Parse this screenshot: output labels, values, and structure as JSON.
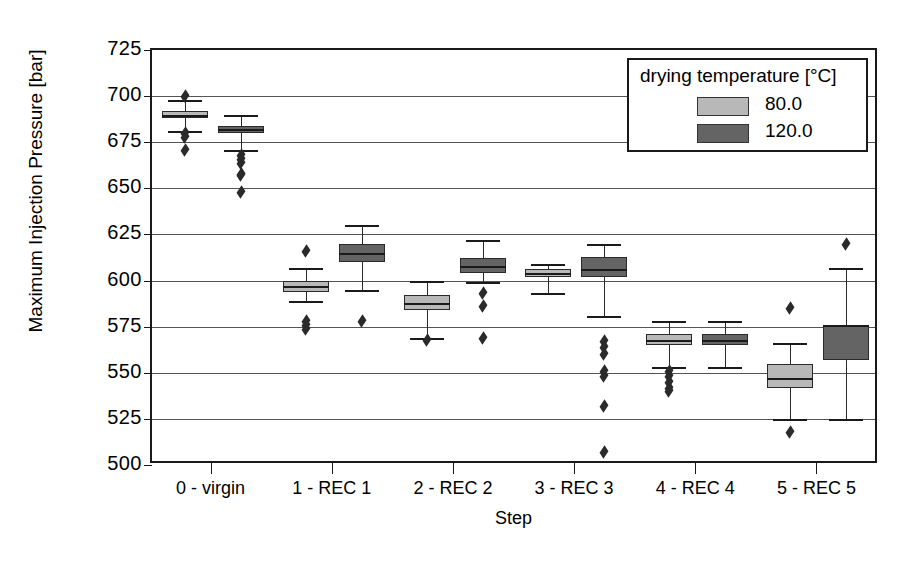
{
  "chart_data": {
    "type": "box",
    "title": "",
    "xlabel": "Step",
    "ylabel": "Maximum Injection Pressure  [bar]",
    "ylim": [
      500,
      725
    ],
    "ytick_step": 25,
    "yticks": [
      725,
      700,
      675,
      650,
      625,
      600,
      575,
      550,
      525,
      500
    ],
    "grid": true,
    "categories": [
      "0 - virgin",
      "1 - REC 1",
      "2 - REC 2",
      "3 - REC 3",
      "4 - REC 4",
      "5 - REC 5"
    ],
    "legend": {
      "title": "drying temperature [°C]",
      "position": "top-right",
      "entries": [
        {
          "label": "80.0",
          "color": "#b8b8b8"
        },
        {
          "label": "120.0",
          "color": "#646464"
        }
      ]
    },
    "series": [
      {
        "name": "80.0",
        "color": "#b8b8b8",
        "boxes": [
          {
            "category": "0 - virgin",
            "whisker_low": 681.0,
            "q1": 688.0,
            "median": 690.0,
            "q3": 692.0,
            "whisker_high": 698.0,
            "outliers": [
              700.0,
              680.0,
              678.0,
              671.0
            ]
          },
          {
            "category": "1 - REC 1",
            "whisker_low": 589.0,
            "q1": 594.0,
            "median": 597.0,
            "q3": 600.0,
            "whisker_high": 607.0,
            "outliers": [
              616.0,
              578.0,
              576.0,
              574.0
            ]
          },
          {
            "category": "2 - REC 2",
            "whisker_low": 569.0,
            "q1": 584.0,
            "median": 588.0,
            "q3": 592.0,
            "whisker_high": 600.0,
            "outliers": [
              568.0
            ]
          },
          {
            "category": "3 - REC 3",
            "whisker_low": 593.0,
            "q1": 602.0,
            "median": 604.0,
            "q3": 606.0,
            "whisker_high": 609.0,
            "outliers": []
          },
          {
            "category": "4 - REC 4",
            "whisker_low": 553.0,
            "q1": 565.0,
            "median": 568.0,
            "q3": 571.0,
            "whisker_high": 578.0,
            "outliers": [
              551.0,
              548.0,
              545.0,
              542.0,
              540.0
            ]
          },
          {
            "category": "5 - REC 5",
            "whisker_low": 525.0,
            "q1": 542.0,
            "median": 547.0,
            "q3": 555.0,
            "whisker_high": 566.0,
            "outliers": [
              585.0,
              518.0
            ]
          }
        ]
      },
      {
        "name": "120.0",
        "color": "#646464",
        "boxes": [
          {
            "category": "0 - virgin",
            "whisker_low": 671.0,
            "q1": 680.0,
            "median": 682.0,
            "q3": 684.0,
            "whisker_high": 690.0,
            "outliers": [
              668.0,
              666.0,
              664.0,
              658.0,
              657.0,
              648.0
            ]
          },
          {
            "category": "1 - REC 1",
            "whisker_low": 595.0,
            "q1": 610.0,
            "median": 615.0,
            "q3": 620.0,
            "whisker_high": 630.0,
            "outliers": [
              578.0
            ]
          },
          {
            "category": "2 - REC 2",
            "whisker_low": 599.0,
            "q1": 604.0,
            "median": 608.0,
            "q3": 612.0,
            "whisker_high": 622.0,
            "outliers": [
              593.0,
              586.0,
              569.0
            ]
          },
          {
            "category": "3 - REC 3",
            "whisker_low": 581.0,
            "q1": 602.0,
            "median": 606.0,
            "q3": 613.0,
            "whisker_high": 620.0,
            "outliers": [
              567.0,
              564.0,
              560.0,
              551.0,
              548.0,
              532.0,
              507.0
            ]
          },
          {
            "category": "4 - REC 4",
            "whisker_low": 553.0,
            "q1": 565.0,
            "median": 568.0,
            "q3": 571.0,
            "whisker_high": 578.0,
            "outliers": []
          },
          {
            "category": "5 - REC 5",
            "whisker_low": 525.0,
            "q1": 557.0,
            "median": 576.0,
            "q3": 576.0,
            "whisker_high": 607.0,
            "outliers": [
              620.0
            ]
          }
        ]
      }
    ]
  }
}
